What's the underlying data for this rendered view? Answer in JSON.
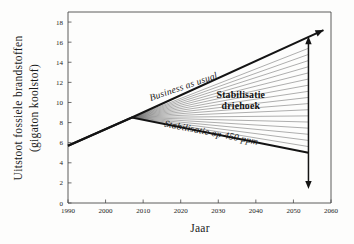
{
  "chart_data": {
    "type": "line",
    "title": "",
    "xlabel": "Jaar",
    "ylabel": "Uitstoot fossiele brandstoffen (gigaton koolstof)",
    "ylabel_line1": "Uitstoot fossiele brandstoffen",
    "ylabel_line2": "(gigaton koolstof)",
    "xlim": [
      1990,
      2060
    ],
    "ylim": [
      0,
      19
    ],
    "grid": false,
    "legend_position": "none",
    "xticks": [
      "1990",
      "2000",
      "2010",
      "2020",
      "2030",
      "2040",
      "2050",
      "2060"
    ],
    "xtick_values": [
      1990,
      2000,
      2010,
      2020,
      2030,
      2040,
      2050,
      2060
    ],
    "yticks": [
      "0",
      "2",
      "4",
      "6",
      "8",
      "10",
      "12",
      "14",
      "16",
      "18"
    ],
    "ytick_values": [
      0,
      2,
      4,
      6,
      8,
      10,
      12,
      14,
      16,
      18
    ],
    "series": [
      {
        "name": "Business as usual",
        "x": [
          1990,
          2007,
          2058
        ],
        "values": [
          5.7,
          8.5,
          17.2
        ],
        "style": "solid-thick-with-arrow"
      },
      {
        "name": "Stabilisatie op 450 ppm",
        "x": [
          1990,
          2007,
          2054
        ],
        "values": [
          5.7,
          8.5,
          5.0
        ],
        "style": "solid-thick"
      }
    ],
    "wedge": {
      "name": "Stabilisatie driehoek",
      "apex_x": 2007,
      "apex_y": 8.5,
      "line_count": 17,
      "right_x": 2054,
      "top_y": 16.0,
      "bottom_y": 5.0
    },
    "annotations": [
      {
        "id": "bau-label",
        "text": "Business as usual",
        "style": "italic",
        "x": 2021,
        "y": 11.3,
        "rotation": -19
      },
      {
        "id": "wedge-label-line1",
        "text": "Stabilisatie",
        "style": "bold",
        "x": 2036,
        "y": 10.4,
        "rotation": 0
      },
      {
        "id": "wedge-label-line2",
        "text": "driehoek",
        "style": "bold",
        "x": 2036,
        "y": 9.4,
        "rotation": 0
      },
      {
        "id": "stabilisation-label",
        "text": "Stabilisatie op 450 ppm",
        "style": "italic",
        "x": 2028,
        "y": 6.7,
        "rotation": 11
      }
    ],
    "arrows": [
      {
        "id": "bau-arrow",
        "direction": "up-right",
        "from_x": 2007,
        "from_y": 8.5,
        "to_x": 2058,
        "to_y": 17.2
      },
      {
        "id": "wedge-gap-arrow",
        "direction": "vertical-double",
        "x": 2054,
        "from_y": 16.0,
        "to_y": 2.0
      }
    ],
    "colors": {
      "background": "#fdfdfc",
      "frame": "#4a4a4a",
      "main_line": "#141414",
      "wedge_line": "#6d6d6d",
      "text": "#1a1a1a"
    }
  }
}
